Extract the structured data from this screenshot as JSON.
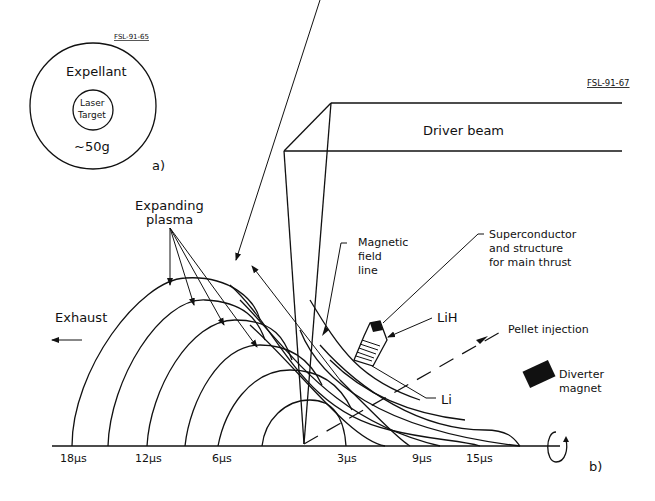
{
  "figure_a": {
    "tag": "FSL-91-65",
    "outer_label": "Expellant",
    "inner_label_line1": "Laser",
    "inner_label_line2": "Target",
    "mass_label": "~50g",
    "panel_label": "a)"
  },
  "figure_b": {
    "tag": "FSL-91-67",
    "driver_beam_label": "Driver beam",
    "expanding_plasma_line1": "Expanding",
    "expanding_plasma_line2": "plasma",
    "exhaust_label": "Exhaust",
    "magnetic_line1": "Magnetic",
    "magnetic_line2": "field",
    "magnetic_line3": "line",
    "superconductor_line1": "Superconductor",
    "superconductor_line2": "and structure",
    "superconductor_line3": "for main thrust",
    "lih_label": "LiH",
    "li_label": "Li",
    "pellet_label": "Pellet injection",
    "diverter_line1": "Diverter",
    "diverter_line2": "magnet",
    "panel_label": "b)",
    "time_labels": {
      "t18": "18μs",
      "t12": "12μs",
      "t6": "6μs",
      "t3": "3μs",
      "t9": "9μs",
      "t15": "15μs"
    }
  }
}
